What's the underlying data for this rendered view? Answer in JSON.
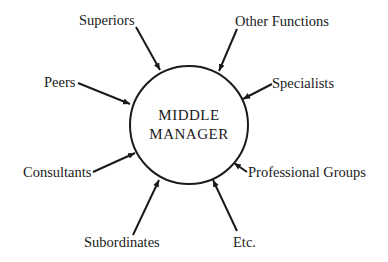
{
  "diagram": {
    "center": {
      "line1": "MIDDLE",
      "line2": "MANAGER"
    },
    "nodes": [
      {
        "id": "superiors",
        "label": "Superiors"
      },
      {
        "id": "other-functions",
        "label": "Other Functions"
      },
      {
        "id": "peers",
        "label": "Peers"
      },
      {
        "id": "specialists",
        "label": "Specialists"
      },
      {
        "id": "consultants",
        "label": "Consultants"
      },
      {
        "id": "professional-groups",
        "label": "Professional Groups"
      },
      {
        "id": "subordinates",
        "label": "Subordinates"
      },
      {
        "id": "etc",
        "label": "Etc."
      }
    ],
    "colors": {
      "ink": "#1a1a1a",
      "background": "#ffffff"
    }
  }
}
